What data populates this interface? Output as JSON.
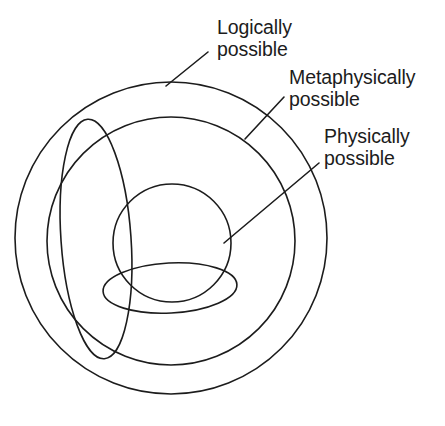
{
  "diagram": {
    "background_color": "#ffffff",
    "stroke_color": "#1c1c1c",
    "labels": {
      "logically": "Logically\npossible",
      "metaphysically": "Metaphysically\npossible",
      "physically": "Physically\npossible"
    },
    "regions": [
      {
        "name": "logically-possible-circle",
        "shape": "circle",
        "center_x": 171,
        "center_y": 238,
        "radius": 156
      },
      {
        "name": "metaphysically-possible-circle",
        "shape": "circle",
        "center_x": 171,
        "center_y": 241,
        "radius": 124
      },
      {
        "name": "physically-possible-circle",
        "shape": "circle",
        "center_x": 172,
        "center_y": 243,
        "radius": 59
      },
      {
        "name": "tall-left-ellipse",
        "shape": "ellipse",
        "center_x": 96,
        "center_y": 239,
        "radius_x": 35,
        "radius_y": 120,
        "rotation_deg": -4
      },
      {
        "name": "flat-bottom-ellipse",
        "shape": "ellipse",
        "center_x": 170,
        "center_y": 288,
        "radius_x": 67,
        "radius_y": 25,
        "rotation_deg": -3
      }
    ],
    "leaders": [
      {
        "name": "leader-logically",
        "x1": 166,
        "y1": 86,
        "x2": 208,
        "y2": 52
      },
      {
        "name": "leader-metaphysically",
        "x1": 245,
        "y1": 139,
        "x2": 284,
        "y2": 97
      },
      {
        "name": "leader-physically",
        "x1": 224,
        "y1": 243,
        "x2": 319,
        "y2": 163
      }
    ]
  }
}
